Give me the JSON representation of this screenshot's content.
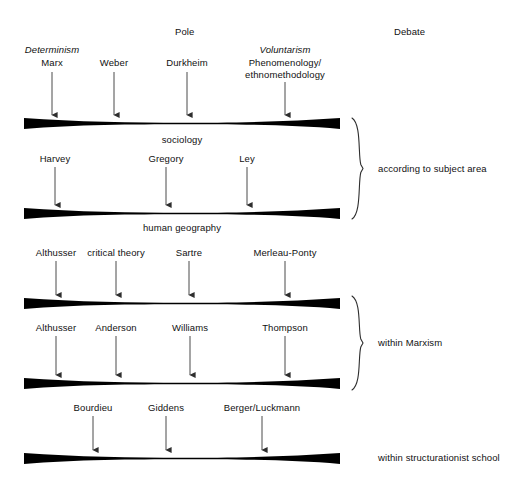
{
  "diagram": {
    "columns": [
      {
        "label": "Pole",
        "x": 175,
        "y": 26
      },
      {
        "label": "Debate",
        "x": 394,
        "y": 26
      }
    ],
    "pole_labels": [
      {
        "label": "Determinism",
        "x": 52,
        "y": 44,
        "italic": true
      },
      {
        "label": "Voluntarism",
        "x": 285,
        "y": 44,
        "italic": true
      }
    ],
    "bars": [
      {
        "id": "bar-sociology",
        "caption": "sociology",
        "caption_x": 182,
        "caption_y": 134,
        "y": 118,
        "x1": 24,
        "x2": 340,
        "inputs_above": [
          {
            "label": "Marx",
            "x": 52,
            "label_y": 57,
            "arrow_from": 72,
            "arrow_to": 115
          },
          {
            "label": "Weber",
            "x": 114,
            "label_y": 57,
            "arrow_from": 72,
            "arrow_to": 115
          },
          {
            "label": "Durkheim",
            "x": 187,
            "label_y": 57,
            "arrow_from": 72,
            "arrow_to": 115
          },
          {
            "label": "Phenomenology/\nethnomethodology",
            "x": 285,
            "label_y": 57,
            "arrow_from": 82,
            "arrow_to": 115
          }
        ]
      },
      {
        "id": "bar-human-geography",
        "caption": "human geography",
        "caption_x": 182,
        "caption_y": 222,
        "y": 208,
        "x1": 24,
        "x2": 340,
        "inputs_above": [
          {
            "label": "Harvey",
            "x": 55,
            "label_y": 153,
            "arrow_from": 167,
            "arrow_to": 205
          },
          {
            "label": "Gregory",
            "x": 166,
            "label_y": 153,
            "arrow_from": 167,
            "arrow_to": 205
          },
          {
            "label": "Ley",
            "x": 247,
            "label_y": 153,
            "arrow_from": 167,
            "arrow_to": 205
          }
        ]
      },
      {
        "id": "bar-marxism-upper",
        "caption": "",
        "caption_x": 182,
        "caption_y": 0,
        "y": 298,
        "x1": 24,
        "x2": 340,
        "inputs_above": [
          {
            "label": "Althusser",
            "x": 56,
            "label_y": 247,
            "arrow_from": 261,
            "arrow_to": 295
          },
          {
            "label": "critical theory",
            "x": 116,
            "label_y": 247,
            "arrow_from": 261,
            "arrow_to": 295
          },
          {
            "label": "Sartre",
            "x": 189,
            "label_y": 247,
            "arrow_from": 261,
            "arrow_to": 295
          },
          {
            "label": "Merleau-Ponty",
            "x": 285,
            "label_y": 247,
            "arrow_from": 261,
            "arrow_to": 295
          }
        ]
      },
      {
        "id": "bar-marxism-lower",
        "caption": "",
        "caption_x": 182,
        "caption_y": 0,
        "y": 378,
        "x1": 24,
        "x2": 340,
        "inputs_above": [
          {
            "label": "Althusser",
            "x": 56,
            "label_y": 322,
            "arrow_from": 336,
            "arrow_to": 375
          },
          {
            "label": "Anderson",
            "x": 116,
            "label_y": 322,
            "arrow_from": 336,
            "arrow_to": 375
          },
          {
            "label": "Williams",
            "x": 190,
            "label_y": 322,
            "arrow_from": 336,
            "arrow_to": 375
          },
          {
            "label": "Thompson",
            "x": 285,
            "label_y": 322,
            "arrow_from": 336,
            "arrow_to": 375
          }
        ]
      },
      {
        "id": "bar-structurationist",
        "caption": "",
        "caption_x": 182,
        "caption_y": 0,
        "y": 453,
        "x1": 24,
        "x2": 340,
        "inputs_above": [
          {
            "label": "Bourdieu",
            "x": 93,
            "label_y": 402,
            "arrow_from": 416,
            "arrow_to": 450
          },
          {
            "label": "Giddens",
            "x": 166,
            "label_y": 402,
            "arrow_from": 416,
            "arrow_to": 450
          },
          {
            "label": "Berger/Luckmann",
            "x": 262,
            "label_y": 402,
            "arrow_from": 416,
            "arrow_to": 450
          }
        ]
      }
    ],
    "braces": [
      {
        "label": "according to subject area",
        "x": 352,
        "y1": 118,
        "y2": 219,
        "label_x": 378,
        "label_y": 163
      },
      {
        "label": "within Marxism",
        "x": 352,
        "y1": 296,
        "y2": 390,
        "label_x": 378,
        "label_y": 337
      }
    ],
    "standalone_labels": [
      {
        "label": "within structurationist school",
        "x": 378,
        "y": 452
      }
    ],
    "colors": {
      "ink": "#111111",
      "bar": "#000000",
      "arrow": "#3a3a3a",
      "background": "#ffffff"
    }
  }
}
